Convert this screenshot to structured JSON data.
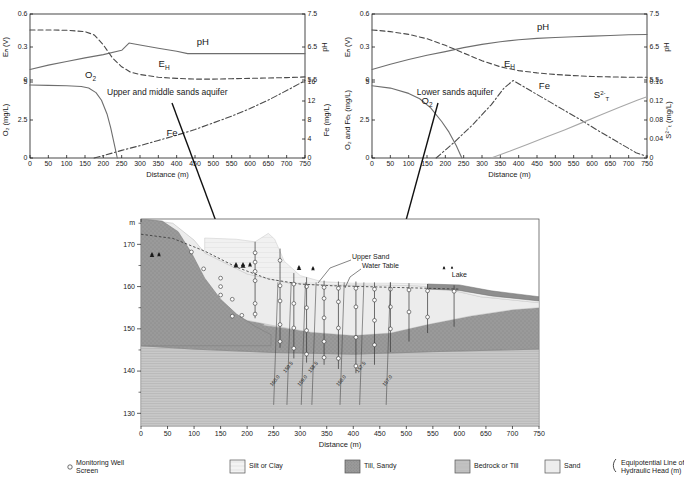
{
  "figure": {
    "top_caption": "",
    "panels": [
      "upper-middle-sands",
      "lower-sands"
    ]
  },
  "chart_data": [
    {
      "id": "upper-middle-sands",
      "type": "line",
      "title": "Upper and middle sands aquifer",
      "xlabel": "Distance (m)",
      "xlim": [
        0,
        750
      ],
      "xticks": [
        0,
        50,
        100,
        150,
        200,
        250,
        300,
        350,
        400,
        450,
        500,
        550,
        600,
        650,
        700,
        750
      ],
      "grid": false,
      "subplots": [
        {
          "id": "redox-ph",
          "ylabel_left": "Eₕ (V)",
          "ylim_left": [
            0,
            0.6
          ],
          "yticks_left": [
            0,
            0.3,
            0.6
          ],
          "ylabel_right": "pH",
          "ylim_right": [
            5.5,
            7.5
          ],
          "yticks_right": [
            5.5,
            6.5,
            7.5
          ],
          "series": [
            {
              "name": "pH",
              "axis": "right",
              "style": "solid",
              "color": "#6e6e6e",
              "x": [
                0,
                50,
                100,
                150,
                200,
                250,
                270,
                300,
                350,
                400,
                430,
                450,
                500,
                600,
                700,
                750
              ],
              "values": [
                5.82,
                5.95,
                6.06,
                6.17,
                6.27,
                6.4,
                6.62,
                6.56,
                6.46,
                6.37,
                6.3,
                6.3,
                6.3,
                6.3,
                6.3,
                6.3
              ]
            },
            {
              "name": "Eₕ",
              "axis": "left",
              "style": "dashed",
              "color": "#4a4a4a",
              "x": [
                0,
                50,
                100,
                150,
                175,
                200,
                225,
                250,
                275,
                300,
                350,
                400,
                450,
                500,
                550,
                600,
                650,
                700,
                750
              ],
              "values": [
                0.455,
                0.455,
                0.452,
                0.44,
                0.41,
                0.32,
                0.2,
                0.12,
                0.07,
                0.05,
                0.025,
                0.015,
                0.008,
                0.008,
                0.012,
                0.015,
                0.018,
                0.022,
                0.028
              ]
            }
          ]
        },
        {
          "id": "oxygen-iron",
          "ylabel_left": "O₂ (mg/L)",
          "ylim_left": [
            0,
            5
          ],
          "yticks_left": [
            0,
            2.5,
            5
          ],
          "ylabel_right": "Fe (mg/L)",
          "ylim_right": [
            0,
            16
          ],
          "yticks_right": [
            0,
            4,
            8,
            12,
            16
          ],
          "series": [
            {
              "name": "O₂",
              "axis": "left",
              "style": "solid",
              "color": "#6e6e6e",
              "x": [
                0,
                50,
                100,
                140,
                160,
                180,
                195,
                210,
                220,
                230,
                238
              ],
              "values": [
                4.8,
                4.78,
                4.75,
                4.7,
                4.6,
                4.3,
                3.8,
                2.9,
                2.0,
                0.9,
                0.0
              ]
            },
            {
              "name": "Fe",
              "axis": "right",
              "style": "dashdot",
              "color": "#4a4a4a",
              "x": [
                175,
                200,
                250,
                300,
                350,
                400,
                450,
                500,
                550,
                600,
                650,
                700,
                750
              ],
              "values": [
                0.0,
                0.5,
                1.6,
                2.6,
                3.7,
                4.8,
                6.0,
                7.4,
                8.8,
                10.4,
                12.2,
                14.2,
                16.3
              ]
            }
          ]
        }
      ]
    },
    {
      "id": "lower-sands",
      "type": "line",
      "title": "Lower sands aquifer",
      "xlabel": "Distance (m)",
      "xlim": [
        0,
        750
      ],
      "xticks": [
        0,
        50,
        100,
        150,
        200,
        250,
        300,
        350,
        400,
        450,
        500,
        550,
        600,
        650,
        700,
        750
      ],
      "grid": false,
      "subplots": [
        {
          "id": "redox-ph",
          "ylabel_left": "Eₕ (V)",
          "ylim_left": [
            0,
            0.6
          ],
          "yticks_left": [
            0,
            0.3,
            0.6
          ],
          "ylabel_right": "pH",
          "ylim_right": [
            5.5,
            7.5
          ],
          "yticks_right": [
            5.5,
            6.5,
            7.5
          ],
          "series": [
            {
              "name": "pH",
              "axis": "right",
              "style": "solid",
              "color": "#6e6e6e",
              "x": [
                0,
                50,
                100,
                150,
                200,
                250,
                300,
                350,
                400,
                450,
                500,
                550,
                600,
                650,
                700,
                750
              ],
              "values": [
                5.82,
                5.98,
                6.12,
                6.25,
                6.36,
                6.48,
                6.58,
                6.66,
                6.72,
                6.76,
                6.79,
                6.81,
                6.83,
                6.85,
                6.87,
                6.88
              ]
            },
            {
              "name": "Eₕ",
              "axis": "left",
              "style": "dashed",
              "color": "#4a4a4a",
              "x": [
                0,
                50,
                100,
                150,
                200,
                250,
                300,
                350,
                400,
                450,
                500,
                550,
                600,
                650,
                700,
                750
              ],
              "values": [
                0.455,
                0.44,
                0.415,
                0.375,
                0.315,
                0.245,
                0.175,
                0.12,
                0.085,
                0.065,
                0.05,
                0.04,
                0.032,
                0.028,
                0.025,
                0.025
              ]
            }
          ]
        },
        {
          "id": "oxygen-iron-sulfide",
          "ylabel_left": "O₂ and Feₜ (mg/L)",
          "ylim_left": [
            0,
            5
          ],
          "yticks_left": [
            0,
            2.5,
            5
          ],
          "ylabel_right": "S²⁻ₜ (mg/L)",
          "ylim_right": [
            0,
            0.16
          ],
          "yticks_right": [
            0,
            0.04,
            0.08,
            0.12,
            0.16
          ],
          "series": [
            {
              "name": "O₂",
              "axis": "left",
              "style": "solid",
              "color": "#6e6e6e",
              "x": [
                0,
                50,
                100,
                130,
                160,
                190,
                210,
                230,
                245
              ],
              "values": [
                4.75,
                4.6,
                4.25,
                3.9,
                3.3,
                2.4,
                1.7,
                0.8,
                0.0
              ]
            },
            {
              "name": "Fe",
              "axis": "left",
              "style": "dashdot",
              "color": "#4a4a4a",
              "x": [
                175,
                225,
                275,
                325,
                360,
                385,
                420,
                470,
                520,
                570,
                620,
                670,
                720,
                750
              ],
              "values": [
                0.0,
                1.05,
                2.2,
                3.5,
                4.6,
                5.1,
                4.6,
                3.9,
                3.2,
                2.5,
                1.75,
                1.05,
                0.35,
                0.1
              ]
            },
            {
              "name": "S²⁻ₜ",
              "axis": "right",
              "style": "solid",
              "color": "#a8a8a8",
              "x": [
                325,
                375,
                425,
                475,
                525,
                575,
                625,
                675,
                725,
                750
              ],
              "values": [
                0.0,
                0.014,
                0.029,
                0.044,
                0.059,
                0.075,
                0.091,
                0.107,
                0.122,
                0.129
              ]
            }
          ]
        }
      ]
    },
    {
      "id": "cross-section",
      "type": "diagram",
      "title": "Hydrogeologic cross-section",
      "xlabel": "Distance (m)",
      "xlim": [
        0,
        750
      ],
      "xticks": [
        0,
        50,
        100,
        150,
        200,
        250,
        300,
        350,
        400,
        450,
        500,
        550,
        600,
        650,
        700,
        750
      ],
      "ylabel": "m",
      "ylim": [
        127,
        176
      ],
      "yticks": [
        130,
        140,
        150,
        160,
        170
      ],
      "annotations": [
        {
          "label": "Upper Sand",
          "x": 370,
          "y": 166
        },
        {
          "label": "Water Table",
          "x": 385,
          "y": 163
        },
        {
          "label": "Lake",
          "x": 600,
          "y": 161
        }
      ],
      "equipotential_labels": [
        "160.0",
        "159.5",
        "159.0",
        "158.5",
        "158.0",
        "157.5",
        "157.0"
      ]
    }
  ],
  "legend": {
    "items": [
      {
        "key": "monitoring-well-screen",
        "label": "Monitoring Well\nScreen",
        "swatch": "circle",
        "color": "#ffffff"
      },
      {
        "key": "silt-or-clay",
        "label": "Silt or Clay",
        "swatch": "hatch-light",
        "color": "#f0f0f0"
      },
      {
        "key": "till-sandy",
        "label": "Till, Sandy",
        "swatch": "dots-dark",
        "color": "#9a9a9a"
      },
      {
        "key": "bedrock-or-till",
        "label": "Bedrock or Till",
        "swatch": "hatch-mid",
        "color": "#bdbdbd"
      },
      {
        "key": "sand",
        "label": "Sand",
        "swatch": "plain",
        "color": "#e8e8e8"
      },
      {
        "key": "equipotential-line",
        "label": "Equipotential Line of\nHydraulic Head (m)",
        "swatch": "line-curve",
        "color": "#1a1a1a"
      }
    ]
  },
  "colors": {
    "axis": "#1a1a1a",
    "ph_line": "#6e6e6e",
    "eh_line": "#4a4a4a",
    "o2_line": "#6e6e6e",
    "fe_line": "#4a4a4a",
    "s_line": "#a8a8a8",
    "till": "#9a9a9a",
    "bedrock": "#c4c4c4",
    "sand": "#ebebeb",
    "silt": "#f2f2f2",
    "lake": "#8a8a8a"
  }
}
